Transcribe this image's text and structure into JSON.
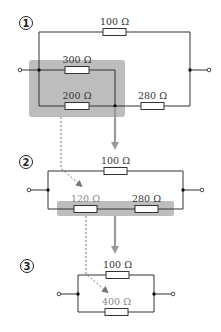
{
  "diagram": {
    "colors": {
      "wire": "#333333",
      "highlight": "#bdbdbd",
      "arrow": "#9a9a9a",
      "dashed": "#666666"
    },
    "steps": [
      {
        "number": "1",
        "resistors": [
          {
            "id": "r100",
            "label": "100 Ω"
          },
          {
            "id": "r300",
            "label": "300 Ω"
          },
          {
            "id": "r200",
            "label": "200 Ω"
          },
          {
            "id": "r280",
            "label": "280 Ω"
          }
        ],
        "highlight": "300 Ω ∥ 200 Ω"
      },
      {
        "number": "2",
        "resistors": [
          {
            "id": "r100",
            "label": "100 Ω"
          },
          {
            "id": "r120",
            "label": "120 Ω"
          },
          {
            "id": "r280",
            "label": "280 Ω"
          }
        ],
        "highlight": "120 Ω + 280 Ω"
      },
      {
        "number": "3",
        "resistors": [
          {
            "id": "r100",
            "label": "100 Ω"
          },
          {
            "id": "r400",
            "label": "400 Ω"
          }
        ]
      }
    ]
  }
}
